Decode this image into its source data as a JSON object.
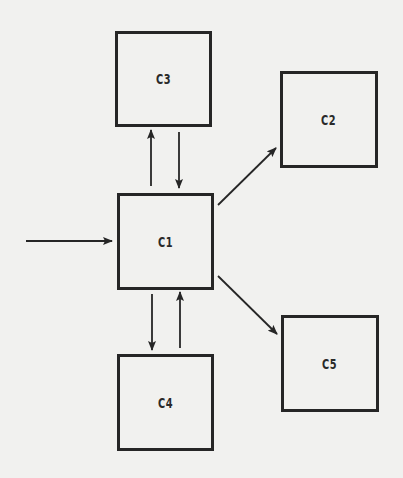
{
  "diagram": {
    "type": "block-flow",
    "colors": {
      "background": "#f1f1ef",
      "stroke": "#262626",
      "text": "#2a2a2a"
    },
    "nodes": [
      {
        "id": "C1",
        "label": "C1",
        "x": 117,
        "y": 193,
        "w": 97,
        "h": 97
      },
      {
        "id": "C2",
        "label": "C2",
        "x": 280,
        "y": 71,
        "w": 98,
        "h": 97
      },
      {
        "id": "C3",
        "label": "C3",
        "x": 115,
        "y": 31,
        "w": 97,
        "h": 96
      },
      {
        "id": "C4",
        "label": "C4",
        "x": 117,
        "y": 354,
        "w": 97,
        "h": 97
      },
      {
        "id": "C5",
        "label": "C5",
        "x": 281,
        "y": 315,
        "w": 98,
        "h": 97
      }
    ],
    "edges": [
      {
        "from": "external",
        "to": "C1",
        "x1": 26,
        "y1": 241,
        "x2": 112,
        "y2": 241
      },
      {
        "from": "C1",
        "to": "C3",
        "x1": 151,
        "y1": 186,
        "x2": 151,
        "y2": 130
      },
      {
        "from": "C3",
        "to": "C1",
        "x1": 179,
        "y1": 132,
        "x2": 179,
        "y2": 188
      },
      {
        "from": "C1",
        "to": "C2",
        "x1": 218,
        "y1": 205,
        "x2": 276,
        "y2": 148
      },
      {
        "from": "C1",
        "to": "C5",
        "x1": 218,
        "y1": 276,
        "x2": 277,
        "y2": 334
      },
      {
        "from": "C1",
        "to": "C4",
        "x1": 152,
        "y1": 294,
        "x2": 152,
        "y2": 350
      },
      {
        "from": "C4",
        "to": "C1",
        "x1": 180,
        "y1": 348,
        "x2": 180,
        "y2": 292
      }
    ]
  }
}
